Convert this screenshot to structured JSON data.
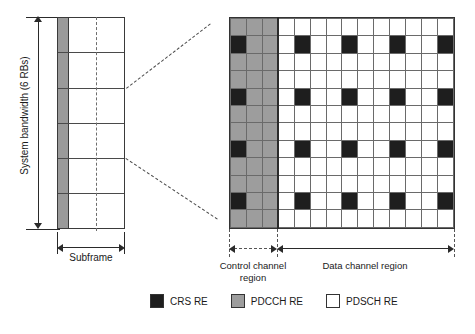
{
  "figure": {
    "bandwidth_label": "System bandwidth (6 RBs)",
    "subframe_label": "Subframe",
    "control_region_label": "Control channel\nregion",
    "control_region_line1": "Control channel",
    "control_region_line2": "region",
    "data_region_label": "Data channel region"
  },
  "left_panel": {
    "resource_blocks": 6,
    "control_column_shaded": true
  },
  "grid": {
    "rows": 12,
    "columns": 14,
    "control_columns": 3,
    "data_columns": 11,
    "crs_rows": [
      1,
      4,
      7,
      10
    ],
    "crs_control_columns": [
      0
    ],
    "crs_data_columns": [
      4,
      7,
      10,
      13
    ],
    "cells": [
      [
        "pdcch",
        "pdcch",
        "pdcch",
        "pdsch",
        "pdsch",
        "pdsch",
        "pdsch",
        "pdsch",
        "pdsch",
        "pdsch",
        "pdsch",
        "pdsch",
        "pdsch",
        "pdsch"
      ],
      [
        "crs",
        "pdcch",
        "pdcch",
        "pdsch",
        "crs",
        "pdsch",
        "pdsch",
        "crs",
        "pdsch",
        "pdsch",
        "crs",
        "pdsch",
        "pdsch",
        "crs"
      ],
      [
        "pdcch",
        "pdcch",
        "pdcch",
        "pdsch",
        "pdsch",
        "pdsch",
        "pdsch",
        "pdsch",
        "pdsch",
        "pdsch",
        "pdsch",
        "pdsch",
        "pdsch",
        "pdsch"
      ],
      [
        "pdcch",
        "pdcch",
        "pdcch",
        "pdsch",
        "pdsch",
        "pdsch",
        "pdsch",
        "pdsch",
        "pdsch",
        "pdsch",
        "pdsch",
        "pdsch",
        "pdsch",
        "pdsch"
      ],
      [
        "crs",
        "pdcch",
        "pdcch",
        "pdsch",
        "crs",
        "pdsch",
        "pdsch",
        "crs",
        "pdsch",
        "pdsch",
        "crs",
        "pdsch",
        "pdsch",
        "crs"
      ],
      [
        "pdcch",
        "pdcch",
        "pdcch",
        "pdsch",
        "pdsch",
        "pdsch",
        "pdsch",
        "pdsch",
        "pdsch",
        "pdsch",
        "pdsch",
        "pdsch",
        "pdsch",
        "pdsch"
      ],
      [
        "pdcch",
        "pdcch",
        "pdcch",
        "pdsch",
        "pdsch",
        "pdsch",
        "pdsch",
        "pdsch",
        "pdsch",
        "pdsch",
        "pdsch",
        "pdsch",
        "pdsch",
        "pdsch"
      ],
      [
        "crs",
        "pdcch",
        "pdcch",
        "pdsch",
        "crs",
        "pdsch",
        "pdsch",
        "crs",
        "pdsch",
        "pdsch",
        "crs",
        "pdsch",
        "pdsch",
        "crs"
      ],
      [
        "pdcch",
        "pdcch",
        "pdcch",
        "pdsch",
        "pdsch",
        "pdsch",
        "pdsch",
        "pdsch",
        "pdsch",
        "pdsch",
        "pdsch",
        "pdsch",
        "pdsch",
        "pdsch"
      ],
      [
        "pdcch",
        "pdcch",
        "pdcch",
        "pdsch",
        "pdsch",
        "pdsch",
        "pdsch",
        "pdsch",
        "pdsch",
        "pdsch",
        "pdsch",
        "pdsch",
        "pdsch",
        "pdsch"
      ],
      [
        "crs",
        "pdcch",
        "pdcch",
        "pdsch",
        "crs",
        "pdsch",
        "pdsch",
        "crs",
        "pdsch",
        "pdsch",
        "crs",
        "pdsch",
        "pdsch",
        "crs"
      ],
      [
        "pdcch",
        "pdcch",
        "pdcch",
        "pdsch",
        "pdsch",
        "pdsch",
        "pdsch",
        "pdsch",
        "pdsch",
        "pdsch",
        "pdsch",
        "pdsch",
        "pdsch",
        "pdsch"
      ]
    ]
  },
  "legend": {
    "items": [
      {
        "label": "CRS RE",
        "swatch": "crs",
        "color": "#1e1e1e"
      },
      {
        "label": "PDCCH RE",
        "swatch": "pdcch",
        "color": "#9d9d9d"
      },
      {
        "label": "PDSCH RE",
        "swatch": "pdsch",
        "color": "#ffffff"
      }
    ]
  },
  "colors": {
    "crs": "#1e1e1e",
    "pdcch": "#9d9d9d",
    "pdsch": "#ffffff",
    "grid_line": "#6a6a6a",
    "outline": "#333333",
    "dashed": "#555555"
  }
}
